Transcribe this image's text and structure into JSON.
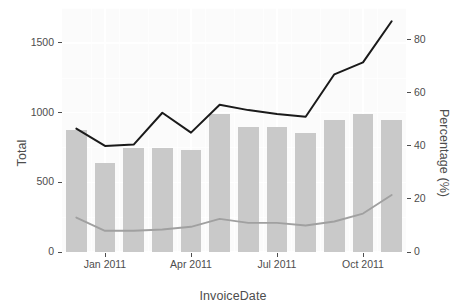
{
  "chart_data": {
    "type": "bar",
    "title": "",
    "xlabel": "InvoiceDate",
    "ylabel": "Total",
    "y2label": "Percentage (%)",
    "categories": [
      "Dec 2010",
      "Jan 2011",
      "Feb 2011",
      "Mar 2011",
      "Apr 2011",
      "May 2011",
      "Jun 2011",
      "Jul 2011",
      "Aug 2011",
      "Sep 2011",
      "Oct 2011",
      "Nov 2011"
    ],
    "x_tick_labels": [
      "Jan 2011",
      "Apr 2011",
      "Jul 2011",
      "Oct 2011"
    ],
    "x_tick_indices": [
      1,
      4,
      7,
      10
    ],
    "y_tick_labels": [
      "0",
      "500",
      "1000",
      "1500"
    ],
    "y_tick_values": [
      0,
      500,
      1000,
      1500
    ],
    "ylim": [
      0,
      1750
    ],
    "y2_tick_labels": [
      "0",
      "20",
      "40",
      "60",
      "80"
    ],
    "y2_tick_values": [
      0,
      20,
      40,
      60,
      80
    ],
    "y2lim": [
      0,
      92
    ],
    "grid": true,
    "legend_position": "none",
    "bar_color": "#c9c9c9",
    "line_dark_color": "#1a1a1a",
    "line_light_color": "#a0a0a0",
    "panel_background": "#fbfbfb",
    "series": [
      {
        "name": "Total",
        "type": "bar",
        "axis": "left",
        "values": [
          875,
          640,
          745,
          745,
          730,
          990,
          900,
          900,
          855,
          945,
          990,
          945
        ]
      },
      {
        "name": "Cumulative Percentage",
        "type": "line",
        "axis": "right",
        "values": [
          46.5,
          40.0,
          40.5,
          52.5,
          45.0,
          55.5,
          53.5,
          52.0,
          51.0,
          67.0,
          71.5,
          87.0
        ]
      },
      {
        "name": "Percentage",
        "type": "line",
        "axis": "right",
        "values": [
          13.0,
          8.0,
          8.0,
          8.5,
          9.5,
          12.5,
          11.0,
          11.0,
          10.0,
          11.5,
          14.5,
          21.5
        ]
      }
    ]
  }
}
